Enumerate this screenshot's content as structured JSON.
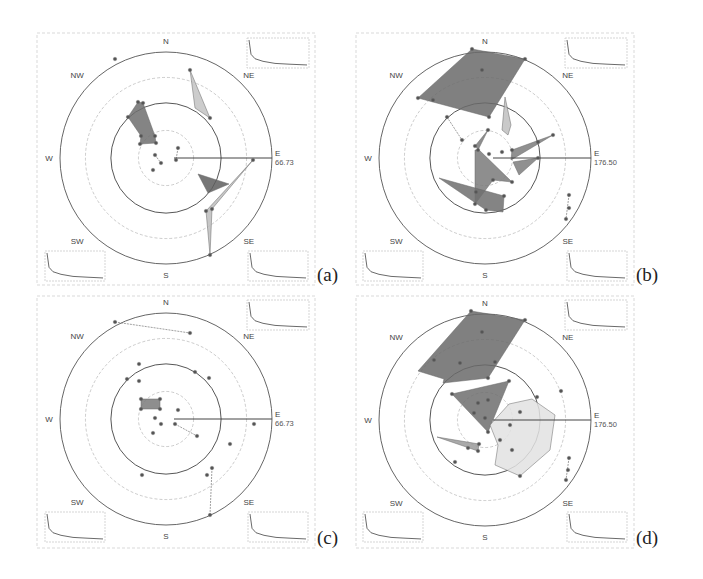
{
  "figure": {
    "panels": [
      {
        "id": "a",
        "caption": "(a)",
        "box": {
          "x": 37,
          "y": 33,
          "w": 278,
          "h": 252
        },
        "center": {
          "x": 166,
          "y": 158
        },
        "radius": 106,
        "directions": [
          "N",
          "NE",
          "E",
          "SE",
          "S",
          "SW",
          "W",
          "NW"
        ],
        "scale_label": "E",
        "scale_value": "66.73",
        "polygons": [
          {
            "fill": "#6e6e6e",
            "points": [
              [
                138,
                102
              ],
              [
                128,
                117
              ],
              [
                141,
                136
              ],
              [
                140,
                144
              ],
              [
                156,
                143
              ],
              [
                155,
                136
              ],
              [
                143,
                103
              ]
            ]
          },
          {
            "fill": "#c3c3c3",
            "points": [
              [
                190,
                70
              ],
              [
                210,
                118
              ],
              [
                195,
                108
              ]
            ]
          },
          {
            "fill": "#5e5e5e",
            "points": [
              [
                198,
                174
              ],
              [
                229,
                184
              ],
              [
                208,
                193
              ]
            ]
          },
          {
            "fill": "#bdbdbd",
            "points": [
              [
                253,
                160
              ],
              [
                206,
                211
              ],
              [
                210,
                255
              ],
              [
                212,
                209
              ]
            ]
          }
        ],
        "points": [
          [
            115,
            59
          ],
          [
            190,
            70
          ],
          [
            210,
            118
          ],
          [
            138,
            102
          ],
          [
            128,
            117
          ],
          [
            141,
            136
          ],
          [
            140,
            144
          ],
          [
            156,
            143
          ],
          [
            155,
            136
          ],
          [
            143,
            103
          ],
          [
            178,
            148
          ],
          [
            176,
            160
          ],
          [
            155,
            155
          ],
          [
            161,
            163
          ],
          [
            153,
            170
          ],
          [
            253,
            160
          ],
          [
            206,
            211
          ],
          [
            210,
            255
          ],
          [
            212,
            209
          ]
        ],
        "segments": [
          [
            [
              178,
              148
            ],
            [
              176,
              160
            ]
          ],
          [
            [
              155,
              155
            ],
            [
              161,
              163
            ]
          ]
        ],
        "sparklines": [
          {
            "pos": "ne",
            "x": 247,
            "y": 38,
            "w": 62,
            "h": 30
          },
          {
            "pos": "sw",
            "x": 45,
            "y": 251,
            "w": 60,
            "h": 30
          },
          {
            "pos": "se",
            "x": 248,
            "y": 251,
            "w": 60,
            "h": 30
          }
        ]
      },
      {
        "id": "b",
        "caption": "(b)",
        "box": {
          "x": 356,
          "y": 33,
          "w": 278,
          "h": 252
        },
        "center": {
          "x": 485,
          "y": 158
        },
        "radius": 106,
        "directions": [
          "N",
          "NE",
          "E",
          "SE",
          "S",
          "SW",
          "W",
          "NW"
        ],
        "scale_label": "E",
        "scale_value": "176.50",
        "polygons": [
          {
            "fill": "#6a6a6a",
            "points": [
              [
                472,
                49
              ],
              [
                525,
                59
              ],
              [
                489,
                117
              ],
              [
                418,
                98
              ]
            ]
          },
          {
            "fill": "#bfbfbf",
            "points": [
              [
                505,
                97
              ],
              [
                511,
                125
              ],
              [
                508,
                135
              ],
              [
                502,
                130
              ]
            ]
          },
          {
            "fill": "#7a7a7a",
            "points": [
              [
                488,
                130
              ],
              [
                475,
                146
              ],
              [
                512,
                182
              ],
              [
                493,
                180
              ],
              [
                475,
                204
              ],
              [
                475,
                150
              ],
              [
                478,
                150
              ]
            ]
          },
          {
            "fill": "#6f6f6f",
            "points": [
              [
                439,
                178
              ],
              [
                504,
                196
              ],
              [
                503,
                212
              ],
              [
                486,
                210
              ]
            ]
          },
          {
            "fill": "#7d7d7d",
            "points": [
              [
                512,
                150
              ],
              [
                553,
                135
              ],
              [
                511,
                160
              ]
            ]
          },
          {
            "fill": "#7d7d7d",
            "points": [
              [
                513,
                162
              ],
              [
                538,
                158
              ],
              [
                519,
                175
              ]
            ]
          }
        ],
        "points": [
          [
            472,
            49
          ],
          [
            525,
            59
          ],
          [
            489,
            117
          ],
          [
            418,
            98
          ],
          [
            482,
            70
          ],
          [
            433,
            100
          ],
          [
            447,
            117
          ],
          [
            462,
            140
          ],
          [
            488,
            130
          ],
          [
            475,
            146
          ],
          [
            478,
            150
          ],
          [
            489,
            154
          ],
          [
            502,
            152
          ],
          [
            512,
            150
          ],
          [
            553,
            135
          ],
          [
            538,
            142
          ],
          [
            538,
            158
          ],
          [
            512,
            182
          ],
          [
            493,
            180
          ],
          [
            475,
            204
          ],
          [
            476,
            192
          ],
          [
            486,
            210
          ],
          [
            504,
            196
          ],
          [
            569,
            195
          ],
          [
            569,
            208
          ],
          [
            566,
            219
          ]
        ],
        "segments": [
          [
            [
              447,
              117
            ],
            [
              462,
              140
            ]
          ],
          [
            [
              569,
              195
            ],
            [
              566,
              219
            ]
          ]
        ],
        "sparklines": [
          {
            "pos": "ne",
            "x": 565,
            "y": 38,
            "w": 62,
            "h": 30
          },
          {
            "pos": "sw",
            "x": 363,
            "y": 251,
            "w": 60,
            "h": 30
          },
          {
            "pos": "se",
            "x": 567,
            "y": 251,
            "w": 60,
            "h": 30
          }
        ]
      },
      {
        "id": "c",
        "caption": "(c)",
        "box": {
          "x": 37,
          "y": 296,
          "w": 278,
          "h": 252
        },
        "center": {
          "x": 166,
          "y": 419
        },
        "radius": 106,
        "directions": [
          "N",
          "NE",
          "E",
          "SE",
          "S",
          "SW",
          "W",
          "NW"
        ],
        "scale_label": "E",
        "scale_value": "66.73",
        "polygons": [
          {
            "fill": "#7a7a7a",
            "points": [
              [
                141,
                399
              ],
              [
                160,
                399
              ],
              [
                160,
                409
              ],
              [
                141,
                409
              ]
            ]
          }
        ],
        "points": [
          [
            115,
            322
          ],
          [
            190,
            333
          ],
          [
            139,
            364
          ],
          [
            127,
            379
          ],
          [
            139,
            381
          ],
          [
            195,
            372
          ],
          [
            209,
            378
          ],
          [
            141,
            399
          ],
          [
            160,
            399
          ],
          [
            160,
            409
          ],
          [
            141,
            409
          ],
          [
            178,
            410
          ],
          [
            155,
            418
          ],
          [
            161,
            424
          ],
          [
            153,
            433
          ],
          [
            175,
            424
          ],
          [
            197,
            436
          ],
          [
            254,
            424
          ],
          [
            230,
            444
          ],
          [
            212,
            468
          ],
          [
            207,
            475
          ],
          [
            210,
            515
          ],
          [
            142,
            475
          ]
        ],
        "segments": [
          [
            [
              115,
              322
            ],
            [
              190,
              333
            ]
          ],
          [
            [
              175,
              424
            ],
            [
              197,
              436
            ]
          ],
          [
            [
              212,
              468
            ],
            [
              210,
              515
            ]
          ]
        ],
        "sparklines": [
          {
            "pos": "ne",
            "x": 247,
            "y": 300,
            "w": 62,
            "h": 30
          },
          {
            "pos": "sw",
            "x": 45,
            "y": 512,
            "w": 60,
            "h": 30
          },
          {
            "pos": "se",
            "x": 248,
            "y": 512,
            "w": 60,
            "h": 30
          }
        ]
      },
      {
        "id": "d",
        "caption": "(d)",
        "box": {
          "x": 356,
          "y": 296,
          "w": 278,
          "h": 252
        },
        "center": {
          "x": 485,
          "y": 420
        },
        "radius": 106,
        "directions": [
          "N",
          "NE",
          "E",
          "SE",
          "S",
          "SW",
          "W",
          "NW"
        ],
        "scale_label": "E",
        "scale_value": "176.50",
        "polygons": [
          {
            "fill": "#6a6a6a",
            "points": [
              [
                471,
                311
              ],
              [
                525,
                320
              ],
              [
                488,
                378
              ],
              [
                443,
                383
              ],
              [
                444,
                379
              ],
              [
                418,
                371
              ]
            ]
          },
          {
            "fill": "#6e6e6e",
            "points": [
              [
                452,
                394
              ],
              [
                509,
                381
              ],
              [
                488,
                432
              ]
            ]
          },
          {
            "fill": "#e2e2e2",
            "points": [
              [
                509,
                404
              ],
              [
                532,
                399
              ],
              [
                555,
                415
              ],
              [
                550,
                450
              ],
              [
                520,
                476
              ],
              [
                495,
                465
              ],
              [
                498,
                445
              ],
              [
                490,
                425
              ]
            ]
          },
          {
            "fill": "#9a9a9a",
            "points": [
              [
                437,
                437
              ],
              [
                479,
                444
              ],
              [
                478,
                451
              ]
            ]
          }
        ],
        "points": [
          [
            471,
            311
          ],
          [
            525,
            320
          ],
          [
            482,
            332
          ],
          [
            434,
            360
          ],
          [
            460,
            363
          ],
          [
            495,
            362
          ],
          [
            488,
            378
          ],
          [
            452,
            394
          ],
          [
            509,
            381
          ],
          [
            488,
            400
          ],
          [
            478,
            403
          ],
          [
            474,
            413
          ],
          [
            485,
            418
          ],
          [
            488,
            432
          ],
          [
            561,
            391
          ],
          [
            537,
            397
          ],
          [
            520,
            412
          ],
          [
            510,
            425
          ],
          [
            500,
            440
          ],
          [
            512,
            450
          ],
          [
            520,
            476
          ],
          [
            479,
            444
          ],
          [
            478,
            451
          ],
          [
            468,
            448
          ],
          [
            455,
            462
          ],
          [
            569,
            458
          ],
          [
            568,
            470
          ],
          [
            566,
            480
          ]
        ],
        "segments": [
          [
            [
              569,
              458
            ],
            [
              566,
              480
            ]
          ]
        ],
        "sparklines": [
          {
            "pos": "ne",
            "x": 565,
            "y": 300,
            "w": 62,
            "h": 30
          },
          {
            "pos": "sw",
            "x": 363,
            "y": 512,
            "w": 60,
            "h": 30
          },
          {
            "pos": "se",
            "x": 567,
            "y": 512,
            "w": 60,
            "h": 30
          }
        ]
      }
    ]
  }
}
